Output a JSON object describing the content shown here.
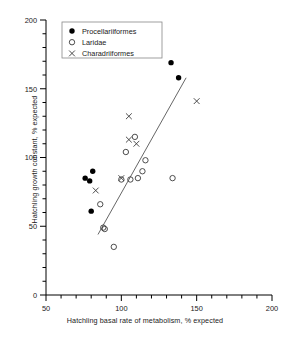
{
  "chart_data": {
    "type": "scatter",
    "title": "",
    "xlabel": "Hatchling basal rate of metabolism, % expected",
    "ylabel": "Hatchling growth constant, % expected",
    "xlim": [
      50,
      200
    ],
    "ylim": [
      0,
      200
    ],
    "xticks": [
      50,
      100,
      150,
      200
    ],
    "yticks": [
      0,
      50,
      100,
      150,
      200
    ],
    "xtick_labels": [
      "50",
      "100",
      "150",
      "200"
    ],
    "ytick_labels": [
      "0",
      "50",
      "100",
      "150",
      "200"
    ],
    "minor_tick_step": 10,
    "grid": false,
    "legend_position": "top-left",
    "series": [
      {
        "name": "Procellariiformes",
        "marker": "filled-circle",
        "color": "#000000",
        "points": [
          {
            "x": 76,
            "y": 85
          },
          {
            "x": 79,
            "y": 83
          },
          {
            "x": 81,
            "y": 90
          },
          {
            "x": 80,
            "y": 61
          },
          {
            "x": 133,
            "y": 169
          },
          {
            "x": 138,
            "y": 158
          }
        ]
      },
      {
        "name": "Laridae",
        "marker": "open-circle",
        "color": "#3a3a3a",
        "points": [
          {
            "x": 86,
            "y": 66
          },
          {
            "x": 88,
            "y": 49
          },
          {
            "x": 89,
            "y": 48
          },
          {
            "x": 95,
            "y": 35
          },
          {
            "x": 103,
            "y": 104
          },
          {
            "x": 106,
            "y": 84
          },
          {
            "x": 109,
            "y": 115
          },
          {
            "x": 111,
            "y": 85
          },
          {
            "x": 114,
            "y": 90
          },
          {
            "x": 116,
            "y": 98
          },
          {
            "x": 134,
            "y": 85
          },
          {
            "x": 100,
            "y": 84
          }
        ]
      },
      {
        "name": "Charadriiformes",
        "marker": "cross",
        "color": "#3a3a3a",
        "points": [
          {
            "x": 83,
            "y": 76
          },
          {
            "x": 100,
            "y": 85
          },
          {
            "x": 105,
            "y": 130
          },
          {
            "x": 105,
            "y": 113
          },
          {
            "x": 110,
            "y": 110
          },
          {
            "x": 150,
            "y": 141
          }
        ]
      }
    ],
    "trend_line": {
      "x1": 84.5,
      "y1": 44,
      "x2": 143,
      "y2": 158
    }
  },
  "legend": {
    "entries": [
      {
        "label": "Procellariiformes"
      },
      {
        "label": "Laridae"
      },
      {
        "label": "Charadriiformes"
      }
    ]
  },
  "axes": {
    "x_title": "Hatchling basal rate of metabolism, % expected",
    "y_title": "Hatchling growth constant, % expected"
  }
}
